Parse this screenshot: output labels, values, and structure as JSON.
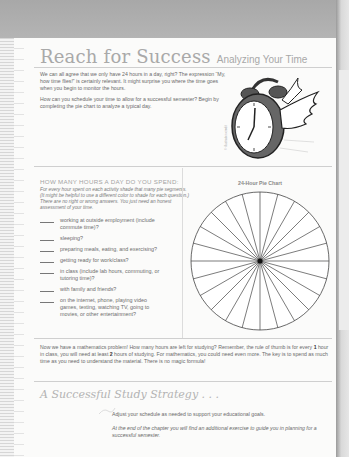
{
  "header": {
    "title": "Reach for Success",
    "subtitle": "Analyzing Your Time"
  },
  "intro": {
    "paragraphs": [
      "We can all agree that we only have 24 hours in a day, right? The expression “My, how time flies!” is certainly relevant. It might surprise you where the time goes when you begin to monitor the hours.",
      "How can you schedule your time to allow for a successful semester? Begin by completing the pie chart to analyze a typical day."
    ]
  },
  "illustration": {
    "icon": "winged-alarm-clock-icon",
    "credit": "© illustration credit"
  },
  "questions": {
    "heading": "HOW MANY HOURS A DAY DO YOU SPEND:",
    "instructions": "For every hour spent on each activity shade that many pie segments. (It might be helpful to use a different color to shade for each question.) There are no right or wrong answers. You just need an honest assessment of your time.",
    "items": [
      {
        "blank": "",
        "text": "working at outside employment (include commute time)?"
      },
      {
        "blank": "",
        "text": "sleeping?"
      },
      {
        "blank": "",
        "text": "preparing meals, eating, and exercising?"
      },
      {
        "blank": "",
        "text": "getting ready for work/class?"
      },
      {
        "blank": "",
        "text": "in class (include lab hours, commuting, or tutoring time)?"
      },
      {
        "blank": "",
        "text": "with family and friends?"
      },
      {
        "blank": "",
        "text": "on the internet, phone, playing video games, texting, watching TV, going to movies, or other entertainment?"
      }
    ]
  },
  "chart": {
    "title": "24-Hour Pie Chart",
    "segments": 24
  },
  "math": {
    "part1": "Now we have a mathematics problem! How many hours are left for studying? Remember, the rule of thumb is for every ",
    "num1": "1",
    "part2": " hour in class, you will need at least ",
    "num2": "2",
    "part3": " hours of studying. For mathematics, you could need even more. The key is to spend as much time as you need to understand the material. There is no magic formula!"
  },
  "strategy": {
    "title": "A Successful Study Strategy . . .",
    "line1": "Adjust your schedule as needed to support your educational goals.",
    "line2": "At the end of the chapter you will find an additional exercise to guide you in planning for a successful semester."
  },
  "colors": {
    "page": "#fbfbfa",
    "title_gray": "#a9a9a9",
    "body_text": "#6a6a6a",
    "scan_background": "#bdbdbd"
  }
}
